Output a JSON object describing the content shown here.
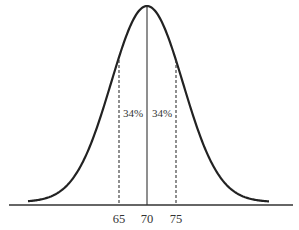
{
  "chart_data": {
    "type": "line",
    "title": "",
    "xlabel": "",
    "ylabel": "",
    "x_ticks": [
      "65",
      "70",
      "75"
    ],
    "mean": 70,
    "std_dev": 5,
    "annotations": [
      {
        "text": "34%",
        "region": "65-70"
      },
      {
        "text": "34%",
        "region": "70-75"
      }
    ],
    "reference_lines": [
      {
        "x": 65,
        "style": "dashed"
      },
      {
        "x": 70,
        "style": "solid"
      },
      {
        "x": 75,
        "style": "dashed"
      }
    ],
    "grid": false,
    "legend": null
  },
  "labels": {
    "tick_65": "65",
    "tick_70": "70",
    "tick_75": "75",
    "left_pct": "34%",
    "right_pct": "34%"
  },
  "colors": {
    "curve": "#222222",
    "axis": "#333333",
    "text": "#333333"
  }
}
